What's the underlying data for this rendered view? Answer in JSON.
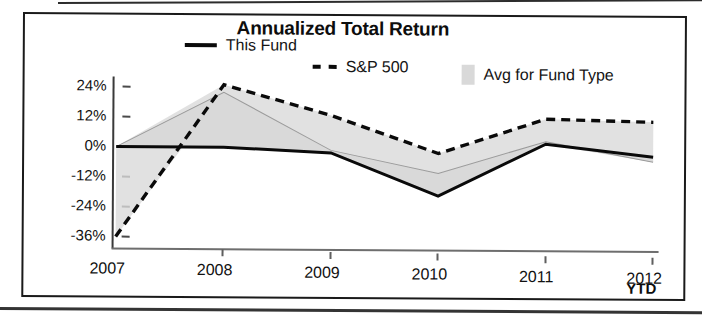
{
  "chart_data": {
    "type": "line",
    "title": "Annualized Total Return",
    "xlabel": "",
    "ylabel": "",
    "ylim": [
      -40,
      28
    ],
    "ytick_values": [
      24,
      12,
      0,
      -12,
      -24,
      -36
    ],
    "ytick_labels": [
      "24%",
      "12%",
      "0%",
      "-12%",
      "-24%",
      "-36%"
    ],
    "categories": [
      "2007",
      "2008",
      "2009",
      "2010",
      "2011",
      "2012"
    ],
    "x_axis_suffix": "YTD",
    "grid": false,
    "legend_position": "top",
    "series": [
      {
        "name": "This Fund",
        "style": "solid-line",
        "color": "#0a0a0a",
        "values": [
          0,
          0,
          -2,
          -19,
          2,
          -3
        ]
      },
      {
        "name": "S&P 500",
        "style": "dashed-line",
        "color": "#0a0a0a",
        "values": [
          -36,
          25,
          13,
          -2,
          12,
          11
        ]
      },
      {
        "name": "Avg for Fund Type",
        "style": "filled-area",
        "color": "#d9d9d9",
        "values": [
          0,
          22,
          -1,
          -10,
          3,
          -5
        ]
      }
    ]
  },
  "chart": {
    "title": "Annualized Total Return",
    "ytd_suffix": "YTD"
  },
  "legend": {
    "items": [
      {
        "label": "This Fund",
        "marker": "solid-line-marker"
      },
      {
        "label": "S&P 500",
        "marker": "dashed-line-marker"
      },
      {
        "label": "Avg for Fund Type",
        "marker": "area-swatch-marker"
      }
    ]
  },
  "axes": {
    "y_labels": [
      "24%",
      "12%",
      "0%",
      "-12%",
      "-24%",
      "-36%"
    ],
    "x_labels": [
      "2007",
      "2008",
      "2009",
      "2010",
      "2011",
      "2012"
    ]
  }
}
